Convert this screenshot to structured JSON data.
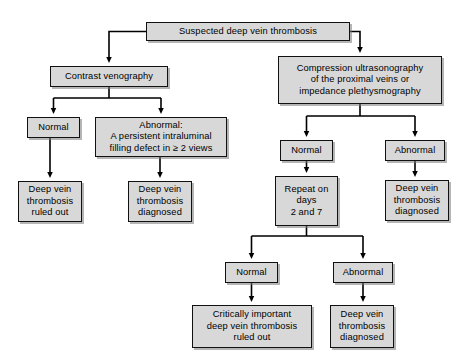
{
  "diagram": {
    "type": "flowchart",
    "colors": {
      "node_fill": "#d8d8d8",
      "node_border": "#111111",
      "link": "#000000",
      "background": "#ffffff"
    },
    "nodes": [
      {
        "id": "root",
        "label": "Suspected deep vein thrombosis",
        "x": 146,
        "y": 22,
        "w": 204,
        "h": 19
      },
      {
        "id": "contrast-venography",
        "label": "Contrast venography",
        "x": 50,
        "y": 66,
        "w": 118,
        "h": 21
      },
      {
        "id": "compression-ultrasonography",
        "label": "Compression ultrasonography\nof the proximal veins or\nimpedance plethysmography",
        "x": 278,
        "y": 56,
        "w": 164,
        "h": 48
      },
      {
        "id": "venography-normal",
        "label": "Normal",
        "x": 27,
        "y": 117,
        "w": 53,
        "h": 21
      },
      {
        "id": "venography-abnormal",
        "label": "Abnormal:\nA persistent intraluminal\nfilling defect in ≥ 2 views",
        "x": 95,
        "y": 117,
        "w": 132,
        "h": 40
      },
      {
        "id": "venography-normal-outcome",
        "label": "Deep vein\nthrombosis\nruled out",
        "x": 18,
        "y": 181,
        "w": 64,
        "h": 41
      },
      {
        "id": "venography-abnormal-outcome",
        "label": "Deep vein\nthrombosis\ndiagnosed",
        "x": 128,
        "y": 181,
        "w": 64,
        "h": 41
      },
      {
        "id": "us-normal",
        "label": "Normal",
        "x": 280,
        "y": 140,
        "w": 53,
        "h": 21
      },
      {
        "id": "us-abnormal",
        "label": "Abnormal",
        "x": 385,
        "y": 140,
        "w": 60,
        "h": 21
      },
      {
        "id": "repeat-testing",
        "label": "Repeat on\ndays\n2 and 7",
        "x": 275,
        "y": 176,
        "w": 63,
        "h": 50
      },
      {
        "id": "us-abnormal-outcome",
        "label": "Deep vein\nthrombosis\ndiagnosed",
        "x": 385,
        "y": 180,
        "w": 64,
        "h": 41
      },
      {
        "id": "repeat-normal",
        "label": "Normal",
        "x": 225,
        "y": 262,
        "w": 53,
        "h": 21
      },
      {
        "id": "repeat-abnormal",
        "label": "Abnormal",
        "x": 333,
        "y": 262,
        "w": 60,
        "h": 21
      },
      {
        "id": "repeat-normal-outcome",
        "label": "Critically important\ndeep vein thrombosis\nruled out",
        "x": 192,
        "y": 305,
        "w": 120,
        "h": 43
      },
      {
        "id": "repeat-abnormal-outcome",
        "label": "Deep vein\nthrombosis\ndiagnosed",
        "x": 330,
        "y": 305,
        "w": 64,
        "h": 43
      }
    ],
    "edges": [
      {
        "from": "root",
        "to": "contrast-venography"
      },
      {
        "from": "root",
        "to": "compression-ultrasonography"
      },
      {
        "from": "contrast-venography",
        "to": "venography-normal"
      },
      {
        "from": "contrast-venography",
        "to": "venography-abnormal"
      },
      {
        "from": "venography-normal",
        "to": "venography-normal-outcome"
      },
      {
        "from": "venography-abnormal",
        "to": "venography-abnormal-outcome"
      },
      {
        "from": "compression-ultrasonography",
        "to": "us-normal"
      },
      {
        "from": "compression-ultrasonography",
        "to": "us-abnormal"
      },
      {
        "from": "us-normal",
        "to": "repeat-testing"
      },
      {
        "from": "us-abnormal",
        "to": "us-abnormal-outcome"
      },
      {
        "from": "repeat-testing",
        "to": "repeat-normal"
      },
      {
        "from": "repeat-testing",
        "to": "repeat-abnormal"
      },
      {
        "from": "repeat-normal",
        "to": "repeat-normal-outcome"
      },
      {
        "from": "repeat-abnormal",
        "to": "repeat-abnormal-outcome"
      }
    ]
  }
}
